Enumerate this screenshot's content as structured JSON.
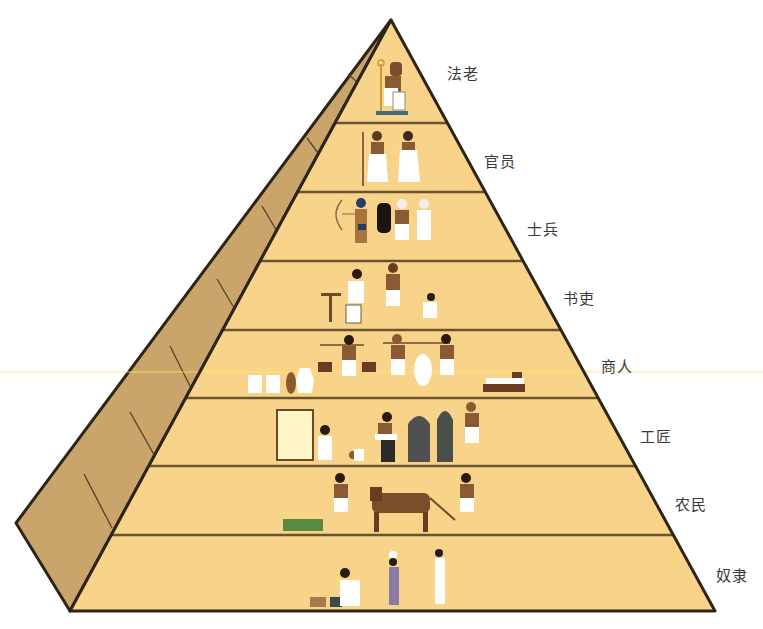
{
  "diagram": {
    "type": "social-pyramid",
    "colors": {
      "front_face": "#f7d48a",
      "side_face": "#c9a56b",
      "outline": "#3a2c1a",
      "tier_line": "#6b5330",
      "label_text": "#3a3a3a"
    },
    "tiers": [
      {
        "rank": 1,
        "label": "法老",
        "meaning": "Pharaoh",
        "figures": [
          "seated pharaoh on throne with staff"
        ]
      },
      {
        "rank": 2,
        "label": "官员",
        "meaning": "Officials",
        "figures": [
          "official with staff",
          "official"
        ]
      },
      {
        "rank": 3,
        "label": "士兵",
        "meaning": "Soldiers",
        "figures": [
          "archer with bow",
          "soldier with shield",
          "soldier"
        ]
      },
      {
        "rank": 4,
        "label": "书吏",
        "meaning": "Scribes",
        "figures": [
          "scribe seated at desk",
          "scribe holding scroll",
          "scribe sitting cross-legged"
        ]
      },
      {
        "rank": 5,
        "label": "商人",
        "meaning": "Merchants",
        "figures": [
          "jars and pots",
          "merchant carrying scale baskets",
          "two merchants carrying sack on pole",
          "stacked goods"
        ]
      },
      {
        "rank": 6,
        "label": "工匠",
        "meaning": "Artisans",
        "figures": [
          "weaver at loom",
          "potter",
          "stone statues",
          "sculptor"
        ]
      },
      {
        "rank": 7,
        "label": "农民",
        "meaning": "Farmers",
        "figures": [
          "crops",
          "farmer with sickle",
          "ox pulling plow",
          "plowman"
        ]
      },
      {
        "rank": 8,
        "label": "奴隶",
        "meaning": "Slaves",
        "figures": [
          "kneeling servant with baskets",
          "woman carrying vessel on head",
          "servant woman"
        ]
      }
    ]
  }
}
